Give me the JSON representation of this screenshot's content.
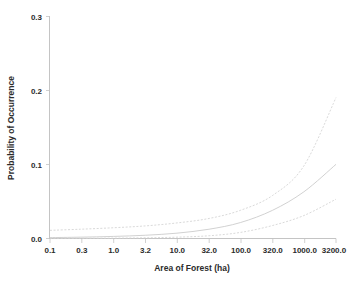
{
  "chart_data": {
    "type": "line",
    "title": "",
    "subtitle": "",
    "xlabel": "Area of Forest (ha)",
    "ylabel": "Probability of Occurrence",
    "xscale": "log",
    "xlim": [
      0.1,
      3200.0
    ],
    "ylim": [
      0.0,
      0.3
    ],
    "grid": false,
    "legend": "none",
    "xtick_labels": [
      "0.1",
      "0.3",
      "1.0",
      "3.2",
      "10.0",
      "32.0",
      "100.0",
      "320.0",
      "1000.0",
      "3200.0"
    ],
    "xtick_values": [
      0.1,
      0.3,
      1.0,
      3.2,
      10.0,
      32.0,
      100.0,
      320.0,
      1000.0,
      3200.0
    ],
    "ytick_labels": [
      "0.0",
      "0.1",
      "0.2",
      "0.3"
    ],
    "ytick_values": [
      0.0,
      0.1,
      0.2,
      0.3
    ],
    "x": [
      0.1,
      0.3,
      1.0,
      3.2,
      10.0,
      32.0,
      100.0,
      320.0,
      1000.0,
      3200.0
    ],
    "series": [
      {
        "name": "Upper 95% confidence limit",
        "style": "dashed",
        "color": "#d2d2d2",
        "values": [
          0.011,
          0.0125,
          0.0145,
          0.017,
          0.021,
          0.027,
          0.038,
          0.058,
          0.098,
          0.19
        ]
      },
      {
        "name": "Predicted probability",
        "style": "solid",
        "color": "#c9c9c9",
        "values": [
          0.0012,
          0.0018,
          0.0028,
          0.0044,
          0.0072,
          0.0125,
          0.0215,
          0.038,
          0.063,
          0.1
        ]
      },
      {
        "name": "Lower 95% confidence limit",
        "style": "dashed",
        "color": "#d2d2d2",
        "values": [
          0.0002,
          0.0003,
          0.0005,
          0.0009,
          0.0018,
          0.0037,
          0.0082,
          0.0175,
          0.031,
          0.053
        ]
      }
    ]
  },
  "axes": {
    "x_title": "Area of Forest (ha)",
    "y_title": "Probability of Occurrence",
    "x_ticks": [
      "0.1",
      "0.3",
      "1.0",
      "3.2",
      "10.0",
      "32.0",
      "100.0",
      "320.0",
      "1000.0",
      "3200.0"
    ],
    "y_ticks": [
      "0.3",
      "0.2",
      "0.1",
      "0.0"
    ]
  },
  "colors": {
    "mean_line": "#c9c9c9",
    "ci_line": "#d2d2d2",
    "axis": "#bdbdbd",
    "text": "#2b2b2b",
    "background": "#ffffff"
  }
}
